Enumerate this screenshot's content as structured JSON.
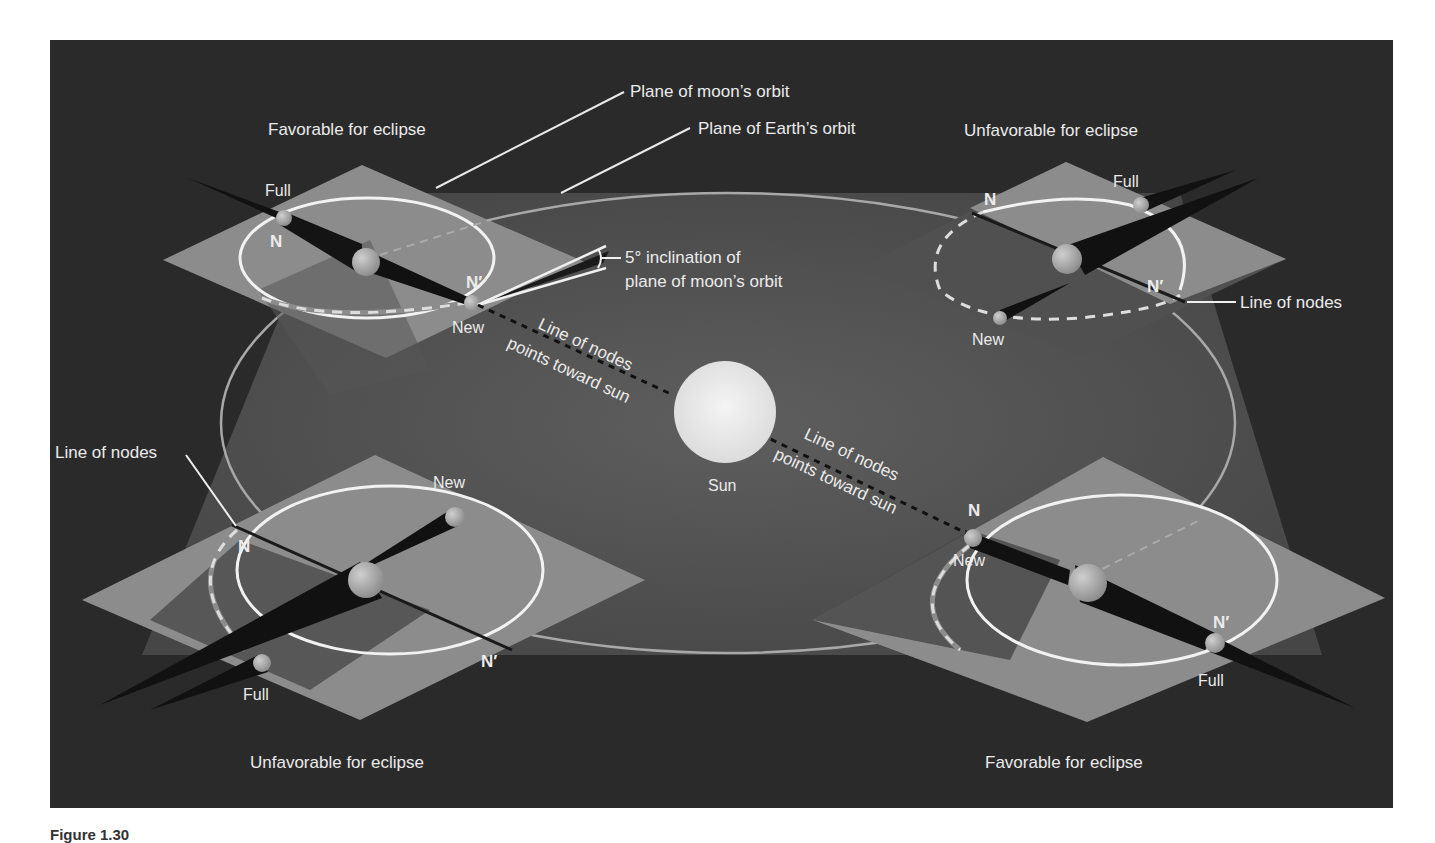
{
  "figure": {
    "caption": "Figure 1.30",
    "colors": {
      "background": "#2a2a2a",
      "earth_plane": "#4e4e4e",
      "moon_plane": "#8c8c8c",
      "moon_plane_shadow": "#3c3c3c",
      "orbit_line": "#a8a8a8",
      "moon_orbit": "#f2f2f2",
      "shadow_cone": "#121212",
      "sun": "#e4e4e4",
      "text": "#ebebeb"
    },
    "labels": {
      "plane_moon_orbit": "Plane of moon’s orbit",
      "plane_earth_orbit": "Plane of Earth’s orbit",
      "inclination_line1": "5° inclination of",
      "inclination_line2": "plane of moon’s orbit",
      "sun": "Sun",
      "line_of_nodes_points_1a": "Line of nodes",
      "line_of_nodes_points_1b": "points toward sun",
      "line_of_nodes_points_2a": "Line of nodes",
      "line_of_nodes_points_2b": "points toward sun"
    },
    "quadrants": {
      "top_left": {
        "title": "Favorable for eclipse",
        "full": "Full",
        "new": "New",
        "node": "N",
        "node_prime": "N′"
      },
      "top_right": {
        "title": "Unfavorable for eclipse",
        "full": "Full",
        "new": "New",
        "node": "N",
        "node_prime": "N′",
        "line_of_nodes": "Line of nodes"
      },
      "bottom_left": {
        "title": "Unfavorable for eclipse",
        "full": "Full",
        "new": "New",
        "node": "N",
        "node_prime": "N′",
        "line_of_nodes": "Line of nodes"
      },
      "bottom_right": {
        "title": "Favorable for eclipse",
        "full": "Full",
        "new": "New",
        "node": "N",
        "node_prime": "N′"
      }
    }
  }
}
